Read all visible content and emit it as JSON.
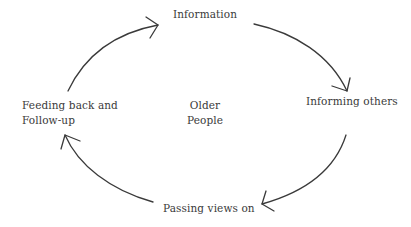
{
  "diagram": {
    "type": "cycle",
    "center_label": "Older\nPeople",
    "center_lines": [
      "Older",
      "People"
    ],
    "nodes": [
      {
        "id": "information",
        "label": "Information"
      },
      {
        "id": "informing-others",
        "label": "Informing others"
      },
      {
        "id": "passing-views-on",
        "label": "Passing views on"
      },
      {
        "id": "feeding-back",
        "label": "Feeding back and Follow-up",
        "lines": [
          "Feeding back and",
          "Follow-up"
        ]
      }
    ],
    "edges": [
      {
        "from": "feeding-back",
        "to": "information"
      },
      {
        "from": "information",
        "to": "informing-others"
      },
      {
        "from": "informing-others",
        "to": "passing-views-on"
      },
      {
        "from": "passing-views-on",
        "to": "feeding-back"
      }
    ],
    "colors": {
      "stroke": "#3a3a3a",
      "text": "#3a3a3a",
      "background": "#ffffff"
    }
  }
}
